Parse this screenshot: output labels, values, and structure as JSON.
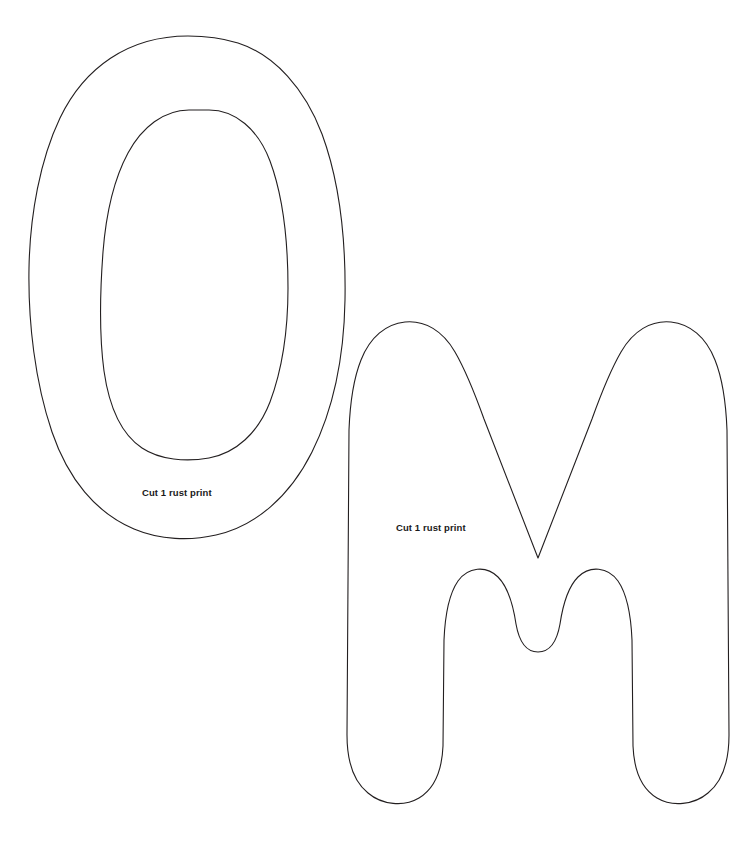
{
  "document": {
    "type": "applique-pattern-sheet",
    "background_color": "#ffffff",
    "stroke_color": "#231f20",
    "stroke_width": 1.1,
    "width": 752,
    "height": 849
  },
  "pieces": [
    {
      "id": "letter-o",
      "letter": "O",
      "label": "Cut 1 rust print",
      "label_position": {
        "x": 142,
        "y": 487
      },
      "bounds": {
        "x": 28,
        "y": 36,
        "width": 318,
        "height": 504
      },
      "has_counter": true,
      "counter_bounds": {
        "x": 99,
        "y": 110,
        "width": 190,
        "height": 349
      }
    },
    {
      "id": "letter-m",
      "letter": "M",
      "label": "Cut 1 rust print",
      "label_position": {
        "x": 396,
        "y": 522
      },
      "bounds": {
        "x": 340,
        "y": 320,
        "width": 362,
        "height": 490
      },
      "has_counter": false,
      "counter_bounds": null
    }
  ],
  "labels": {
    "letter_o_cut": "Cut 1 rust print",
    "letter_m_cut": "Cut 1 rust print"
  }
}
